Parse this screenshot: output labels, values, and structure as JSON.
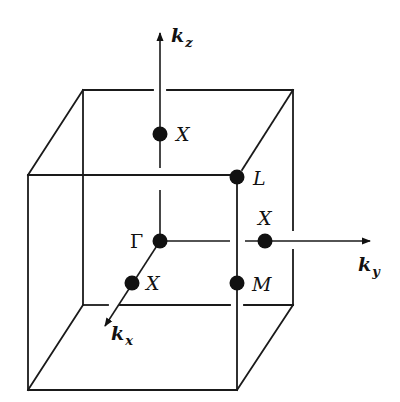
{
  "figure": {
    "axes": {
      "kz": {
        "main": "k",
        "sub": "z"
      },
      "ky": {
        "main": "k",
        "sub": "y"
      },
      "kx": {
        "main": "k",
        "sub": "x"
      }
    },
    "points": {
      "gamma": "Γ",
      "x_top": "X",
      "x_right": "X",
      "x_front": "X",
      "l": "L",
      "m": "M"
    },
    "colors": {
      "line": "#1a1a1a",
      "background": "#ffffff"
    }
  }
}
